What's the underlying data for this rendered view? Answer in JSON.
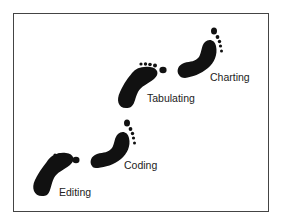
{
  "diagram": {
    "type": "footsteps-progression",
    "steps": [
      {
        "label": "Editing",
        "icon": "footprint-icon",
        "orientation": "toes-up-right"
      },
      {
        "label": "Coding",
        "icon": "footprint-icon",
        "orientation": "toes-up-right-rotated"
      },
      {
        "label": "Tabulating",
        "icon": "footprint-icon",
        "orientation": "toes-up-right"
      },
      {
        "label": "Charting",
        "icon": "footprint-icon",
        "orientation": "toes-up-right-rotated"
      }
    ],
    "colors": {
      "footprint": "#111111",
      "border": "#444444",
      "background": "#ffffff",
      "text": "#222222"
    }
  }
}
